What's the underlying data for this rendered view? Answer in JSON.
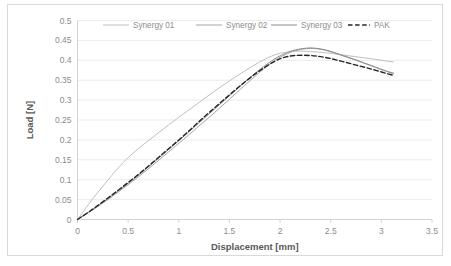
{
  "chart_data": {
    "type": "line",
    "title": "",
    "xlabel": "Displacement [mm]",
    "ylabel": "Load [N]",
    "xlim": [
      0,
      3.5
    ],
    "ylim": [
      0,
      0.5
    ],
    "xticks": [
      "0",
      "0.5",
      "1",
      "1.5",
      "2",
      "2.5",
      "3",
      "3.5"
    ],
    "xtick_values": [
      0,
      0.5,
      1,
      1.5,
      2,
      2.5,
      3,
      3.5
    ],
    "yticks": [
      "0",
      "0.05",
      "0.1",
      "0.15",
      "0.2",
      "0.25",
      "0.3",
      "0.35",
      "0.4",
      "0.45",
      "0.5"
    ],
    "ytick_values": [
      0,
      0.05,
      0.1,
      0.15,
      0.2,
      0.25,
      0.3,
      0.35,
      0.4,
      0.45,
      0.5
    ],
    "grid": "horizontal-none-vertical-none",
    "legend_position": "top",
    "series": [
      {
        "name": "Synergy 01",
        "style": "solid",
        "color": "#bfbfbf",
        "width": 1.0,
        "x": [
          0,
          0.15,
          0.3,
          0.45,
          0.6,
          0.75,
          0.9,
          1.05,
          1.2,
          1.35,
          1.5,
          1.65,
          1.8,
          1.95,
          2.05,
          2.15,
          2.3,
          2.45,
          2.6,
          2.75,
          2.9,
          3.05,
          3.12
        ],
        "y": [
          0,
          0.052,
          0.099,
          0.143,
          0.178,
          0.208,
          0.238,
          0.266,
          0.294,
          0.322,
          0.348,
          0.373,
          0.396,
          0.414,
          0.42,
          0.423,
          0.422,
          0.419,
          0.414,
          0.409,
          0.404,
          0.398,
          0.396
        ]
      },
      {
        "name": "Synergy 02",
        "style": "solid",
        "color": "#a6a6a6",
        "width": 1.0,
        "x": [
          0,
          0.15,
          0.3,
          0.45,
          0.6,
          0.75,
          0.9,
          1.05,
          1.2,
          1.35,
          1.5,
          1.65,
          1.8,
          1.95,
          2.05,
          2.15,
          2.3,
          2.45,
          2.6,
          2.75,
          2.9,
          3.05,
          3.12
        ],
        "y": [
          0,
          0.024,
          0.05,
          0.078,
          0.107,
          0.138,
          0.17,
          0.202,
          0.235,
          0.268,
          0.302,
          0.337,
          0.37,
          0.4,
          0.414,
          0.424,
          0.43,
          0.425,
          0.413,
          0.4,
          0.386,
          0.372,
          0.366
        ]
      },
      {
        "name": "Synergy 03",
        "style": "solid",
        "color": "#8c8c8c",
        "width": 1.0,
        "x": [
          0,
          0.15,
          0.3,
          0.45,
          0.6,
          0.75,
          0.9,
          1.05,
          1.2,
          1.35,
          1.5,
          1.65,
          1.8,
          1.95,
          2.05,
          2.15,
          2.3,
          2.45,
          2.6,
          2.75,
          2.9,
          3.05,
          3.12
        ],
        "y": [
          0,
          0.025,
          0.052,
          0.081,
          0.111,
          0.143,
          0.176,
          0.209,
          0.243,
          0.277,
          0.311,
          0.345,
          0.377,
          0.404,
          0.417,
          0.426,
          0.431,
          0.426,
          0.414,
          0.401,
          0.387,
          0.373,
          0.368
        ]
      },
      {
        "name": "PAK",
        "style": "dashed",
        "color": "#262626",
        "width": 1.4,
        "x": [
          0,
          0.15,
          0.3,
          0.45,
          0.6,
          0.75,
          0.9,
          1.05,
          1.2,
          1.35,
          1.5,
          1.65,
          1.8,
          1.95,
          2.05,
          2.15,
          2.3,
          2.45,
          2.6,
          2.75,
          2.9,
          3.05,
          3.12
        ],
        "y": [
          0,
          0.026,
          0.054,
          0.083,
          0.113,
          0.145,
          0.178,
          0.211,
          0.246,
          0.28,
          0.313,
          0.345,
          0.374,
          0.398,
          0.408,
          0.412,
          0.412,
          0.407,
          0.398,
          0.388,
          0.378,
          0.367,
          0.362
        ]
      }
    ]
  },
  "legend": {
    "items": [
      {
        "label": "Synergy 01",
        "style": "solid",
        "color": "#bfbfbf"
      },
      {
        "label": "Synergy 02",
        "style": "solid",
        "color": "#a6a6a6"
      },
      {
        "label": "Synergy 03",
        "style": "solid",
        "color": "#8c8c8c"
      },
      {
        "label": "PAK",
        "style": "dashed",
        "color": "#262626"
      }
    ]
  },
  "axes": {
    "x_title": "Displacement [mm]",
    "y_title": "Load [N]"
  }
}
